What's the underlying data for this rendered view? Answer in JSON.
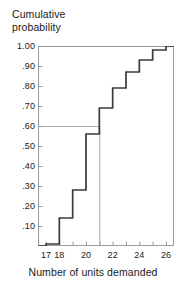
{
  "chart_data": {
    "type": "line",
    "subtype": "step-cdf",
    "title": "",
    "ylabel": "Cumulative\nprobability",
    "xlabel": "Number of units demanded",
    "xlim": [
      16.4,
      26.6
    ],
    "ylim": [
      0,
      1.0
    ],
    "grid": false,
    "legend": null,
    "x_tick_values": [
      17,
      18,
      19,
      20,
      21,
      22,
      23,
      24,
      25,
      26
    ],
    "x_tick_labels": [
      "17",
      "18",
      "",
      "20",
      "",
      "22",
      "",
      "24",
      "",
      "26"
    ],
    "y_tick_values": [
      0.1,
      0.2,
      0.3,
      0.4,
      0.5,
      0.6,
      0.7,
      0.8,
      0.9,
      1.0
    ],
    "y_tick_labels": [
      ".10",
      ".20",
      ".30",
      ".40",
      ".50",
      ".60",
      ".70",
      ".80",
      ".90",
      "1.00"
    ],
    "series": [
      {
        "name": "Cumulative probability",
        "type": "step",
        "step_mode": "post",
        "x": [
          17,
          18,
          19,
          20,
          21,
          22,
          23,
          24,
          25,
          26
        ],
        "values": [
          0.01,
          0.14,
          0.28,
          0.56,
          0.69,
          0.79,
          0.87,
          0.93,
          0.98,
          1.0
        ]
      }
    ],
    "reference_lines": [
      {
        "name": "service-level-line",
        "orientation": "horizontal",
        "value": 0.6,
        "x_from": 16.4,
        "x_to": 21.0
      },
      {
        "name": "order-quantity-line",
        "orientation": "vertical",
        "value": 21,
        "y_from": 0.0,
        "y_to": 0.6
      }
    ],
    "colors": {
      "step_curve": "#3a3a3a",
      "axis": "#9a9a9a",
      "reference_line": "#b0b0b0",
      "text": "#1a1a1a",
      "background": "#ffffff"
    }
  }
}
